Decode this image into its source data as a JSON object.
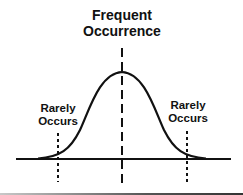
{
  "labels": {
    "top": [
      "Frequent",
      "Occurrence"
    ],
    "left": [
      "Rarely",
      "Occurs"
    ],
    "right": [
      "Rarely",
      "Occurs"
    ]
  },
  "diagram": {
    "type": "normal-distribution-bell-curve",
    "stroke_color": "#111111",
    "background": "#ffffff",
    "center_marker": "dashed-line",
    "tail_markers": "dotted-lines"
  }
}
